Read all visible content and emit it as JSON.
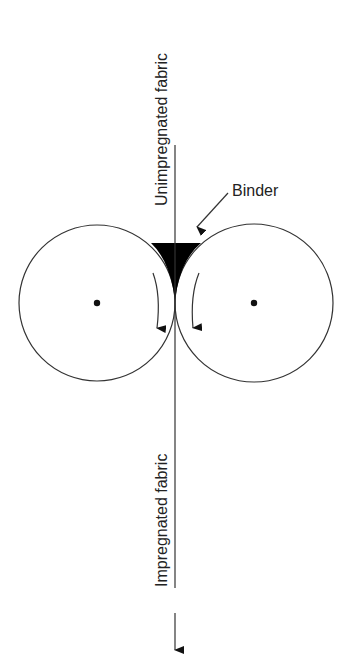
{
  "diagram": {
    "labels": {
      "top_fabric": "Unimpregnated fabric",
      "bottom_fabric": "Impregnated fabric",
      "binder": "Binder"
    },
    "colors": {
      "stroke": "#333333",
      "fill": "#000000",
      "background": "#ffffff"
    },
    "rollers": [
      {
        "name": "left-roller",
        "rotation": "clockwise"
      },
      {
        "name": "right-roller",
        "rotation": "counter-clockwise"
      }
    ]
  }
}
